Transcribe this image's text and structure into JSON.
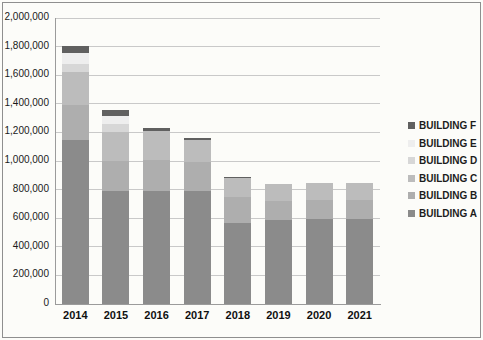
{
  "chart_data": {
    "type": "bar",
    "stacked": true,
    "title": "",
    "xlabel": "",
    "ylabel": "",
    "categories": [
      "2014",
      "2015",
      "2016",
      "2017",
      "2018",
      "2019",
      "2020",
      "2021"
    ],
    "series": [
      {
        "name": "BUILDING A",
        "color": "#8b8b8b",
        "values": [
          1150000,
          790000,
          790000,
          790000,
          570000,
          590000,
          595000,
          595000
        ]
      },
      {
        "name": "BUILDING B",
        "color": "#aeaeae",
        "values": [
          240000,
          210000,
          220000,
          200000,
          175000,
          130000,
          130000,
          130000
        ]
      },
      {
        "name": "BUILDING C",
        "color": "#bcbcbc",
        "values": [
          230000,
          200000,
          200000,
          155000,
          135000,
          120000,
          120000,
          120000
        ]
      },
      {
        "name": "BUILDING D",
        "color": "#d7d7d7",
        "values": [
          60000,
          60000,
          0,
          0,
          0,
          0,
          0,
          0
        ]
      },
      {
        "name": "BUILDING E",
        "color": "#eeeeee",
        "values": [
          75000,
          55000,
          0,
          0,
          0,
          0,
          0,
          0
        ]
      },
      {
        "name": "BUILDING F",
        "color": "#606060",
        "values": [
          50000,
          45000,
          20000,
          15000,
          10000,
          0,
          0,
          0
        ]
      }
    ],
    "totals": [
      1805000,
      1360000,
      1230000,
      1160000,
      890000,
      840000,
      845000,
      845000
    ],
    "ylim": [
      0,
      2000000
    ],
    "ytick_step": 200000,
    "ytick_labels": [
      "0",
      "200,000",
      "400,000",
      "600,000",
      "800,000",
      "1,000,000",
      "1,200,000",
      "1,400,000",
      "1,600,000",
      "1,800,000",
      "2,000,000"
    ],
    "grid": true,
    "legend_position": "right",
    "legend_order": [
      "BUILDING F",
      "BUILDING E",
      "BUILDING D",
      "BUILDING C",
      "BUILDING B",
      "BUILDING A"
    ]
  },
  "style_colors": {
    "gridline": "#c9c9c9",
    "axis": "#9b9b9b",
    "frame_border": "#8f8f8f",
    "background": "#fcfcf9",
    "text": "#1a1a1a"
  }
}
